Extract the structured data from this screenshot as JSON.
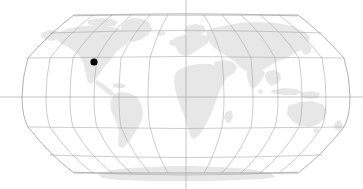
{
  "figure": {
    "type": "world-map",
    "projection": "robinson",
    "width": 363,
    "height": 189,
    "background_color": "#ffffff"
  },
  "colors": {
    "land": "#e7e7e7",
    "ocean": "#ffffff",
    "graticule": "#a9a9a9",
    "globe_outline": "#8f8f8f",
    "marker": "#000000"
  },
  "graticule": {
    "meridian_interval_degrees": 30,
    "parallel_interval_degrees": 30,
    "central_meridian_degrees": 0,
    "meridian_longitudes": [
      -180,
      -150,
      -120,
      -90,
      -60,
      -30,
      0,
      30,
      60,
      90,
      120,
      150,
      180
    ],
    "parallel_latitudes": [
      75,
      60,
      30,
      0,
      -30,
      -60,
      -75
    ],
    "equator_extends_full_width": true,
    "central_meridian_extends_full_height": true
  },
  "markers": [
    {
      "name": "location-marker",
      "label": "",
      "longitude": -122,
      "latitude": 38,
      "x": 94,
      "y": 62,
      "radius": 3.6,
      "color": "#000000"
    }
  ],
  "landmasses": [
    "north-america",
    "south-america",
    "europe",
    "africa",
    "asia",
    "australia",
    "greenland",
    "antarctica",
    "madagascar",
    "new-zealand",
    "japan",
    "british-isles",
    "indonesia"
  ],
  "chart_data": {
    "type": "map",
    "title": "",
    "xlabel": "",
    "ylabel": "",
    "projection": "robinson",
    "legend": [],
    "annotations": [
      {
        "type": "point",
        "x": 94,
        "y": 62,
        "value": "marker"
      }
    ]
  }
}
